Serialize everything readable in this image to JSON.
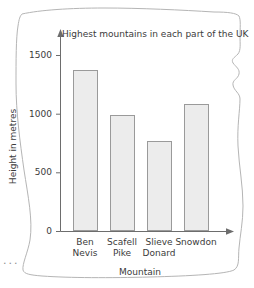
{
  "paper": {
    "ellipsis": "...",
    "edge_color": "#b5b5b5",
    "background": "#ffffff"
  },
  "chart_data": {
    "type": "bar",
    "title": "Highest mountains in each part of the UK",
    "xlabel": "Mountain",
    "ylabel": "Height in metres",
    "categories": [
      "Ben Nevis",
      "Scafell Pike",
      "Slieve Donard",
      "Snowdon"
    ],
    "category_lines": [
      [
        "Ben",
        "Nevis"
      ],
      [
        "Scafell",
        "Pike"
      ],
      [
        "Slieve",
        "Donard"
      ],
      [
        "Snowdon",
        ""
      ]
    ],
    "values": [
      1375,
      990,
      775,
      1090
    ],
    "ylim": [
      0,
      1600
    ],
    "yticks": [
      0,
      500,
      1000,
      1500
    ],
    "ytick_labels": [
      "0",
      "500",
      "1000",
      "1500"
    ],
    "grid": false,
    "legend": false,
    "bar_fill": "#ececec",
    "bar_edge": "#9a9a9a",
    "axis_color": "#6d6d6d",
    "axis_arrows": true
  }
}
